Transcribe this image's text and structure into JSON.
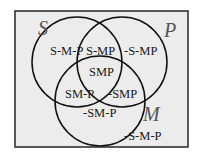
{
  "diagram": {
    "type": "venn-3",
    "background_color": "#ececec",
    "border_color": "#333333",
    "circle_color": "#111111",
    "sets": [
      {
        "name": "S",
        "label": "S"
      },
      {
        "name": "P",
        "label": "P"
      },
      {
        "name": "M",
        "label": "M"
      }
    ],
    "regions": {
      "s_only": "S-M-P",
      "s_p_not_m": "S-MP",
      "p_only": "-S-MP",
      "s_p_m": "SMP",
      "s_m_not_p": "SM-P",
      "p_m_not_s": "-SMP",
      "m_only": "-SM-P",
      "outside": "-S-M-P"
    }
  }
}
